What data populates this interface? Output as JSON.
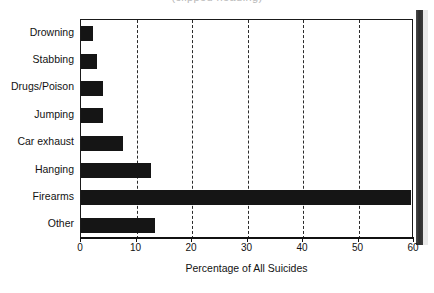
{
  "title_partial": "(clipped heading)",
  "chart_data": {
    "type": "bar",
    "orientation": "horizontal",
    "title": "",
    "xlabel": "Percentage of All Suicides",
    "ylabel": "",
    "xlim": [
      0,
      60
    ],
    "xticks": [
      0,
      10,
      20,
      30,
      40,
      50,
      60
    ],
    "xtick_labels": [
      "0",
      "10",
      "20",
      "30",
      "40",
      "50",
      "60"
    ],
    "grid": "vertical-dashed",
    "legend": "none",
    "bar_color": "#151515",
    "categories": [
      "Drowning",
      "Stabbing",
      "Drugs/Poison",
      "Jumping",
      "Car exhaust",
      "Hanging",
      "Firearms",
      "Other"
    ],
    "values": [
      2.2,
      2.9,
      4.0,
      4.0,
      7.6,
      12.6,
      59.5,
      13.3
    ]
  }
}
